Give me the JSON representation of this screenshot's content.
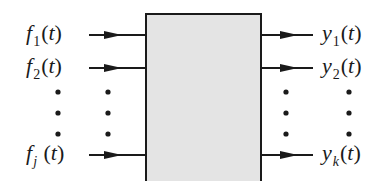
{
  "diagram": {
    "type": "multi-input multi-output system block diagram",
    "block": {
      "fill": "#e4e4e4",
      "stroke": "#1a1a1a"
    },
    "inputs": [
      {
        "name": "f",
        "sub": "1",
        "arg": "t",
        "y": 35
      },
      {
        "name": "f",
        "sub": "2",
        "arg": "t",
        "y": 68
      },
      {
        "name": "f",
        "sub": "j",
        "arg": "t",
        "y": 185
      }
    ],
    "outputs": [
      {
        "name": "y",
        "sub": "1",
        "arg": "t",
        "y": 35
      },
      {
        "name": "y",
        "sub": "2",
        "arg": "t",
        "y": 68
      },
      {
        "name": "y",
        "sub": "k",
        "arg": "t",
        "y": 185
      }
    ],
    "ellipsis": "vertical dots",
    "open_paren": "(",
    "close_paren": ")"
  }
}
